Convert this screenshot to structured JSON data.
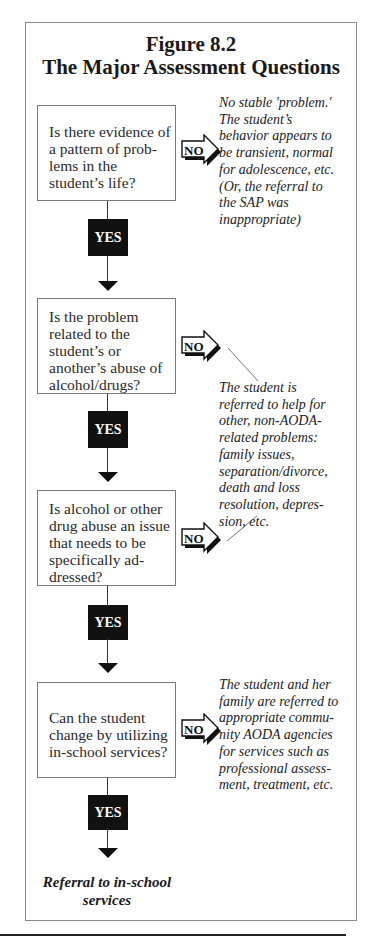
{
  "figure": {
    "number": "Figure 8.2",
    "title": "The Major Assessment Questions"
  },
  "questions": [
    {
      "text": "Is there evidence of a pattern of prob-lems in the student’s life?",
      "lines": [
        "Is there evidence of",
        "a pattern of prob-",
        "lems in the",
        "student’s life?"
      ]
    },
    {
      "text": "Is the problem related to the student’s or another’s abuse of alcohol/drugs?",
      "lines": [
        "Is the problem",
        "related to the",
        "student’s or",
        "another’s abuse of",
        "alcohol/drugs?"
      ]
    },
    {
      "text": "Is alcohol or other drug abuse an issue that needs to be specifically ad-dressed?",
      "lines": [
        "Is alcohol or other",
        "drug abuse an issue",
        "that needs to be",
        "specifically ad-",
        "dressed?"
      ]
    },
    {
      "text": "Can the student change by utilizing in-school services?",
      "lines": [
        "Can the student",
        "change by utilizing",
        "in-school services?"
      ]
    }
  ],
  "branches": {
    "yes_label": "YES",
    "no_label": "NO"
  },
  "outcomes": [
    {
      "lines": [
        "No stable 'problem.'",
        "The student’s",
        "behavior appears to",
        "be transient, normal",
        "for adolescence, etc.",
        "(Or, the referral to",
        "the SAP was",
        "inappropriate)"
      ]
    },
    {
      "lines": [
        "The student is",
        "referred to help for",
        "other, non-AODA-",
        "related problems:",
        "family issues,",
        "separation/divorce,",
        "death and loss",
        "resolution, depres-",
        "sion, etc."
      ]
    },
    {
      "lines": [
        "The student and her",
        "family are referred to",
        "appropriate commu-",
        "nity AODA agencies",
        "for services such as",
        "professional assess-",
        "ment, treatment, etc."
      ]
    }
  ],
  "final_outcome": {
    "lines": [
      "Referral to in-school",
      "services"
    ]
  },
  "colors": {
    "frame_border": "#8a8a8a",
    "yes_box": "#111111",
    "text": "#1a1a1a"
  }
}
